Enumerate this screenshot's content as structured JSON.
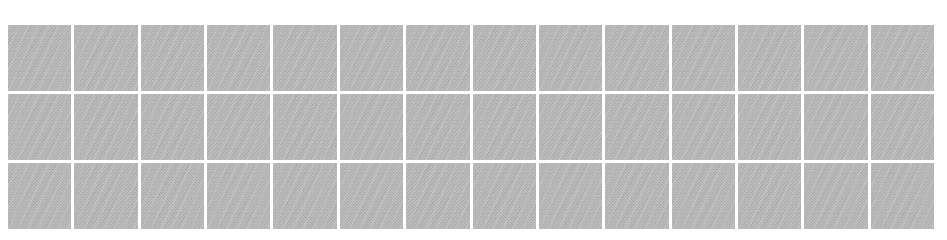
{
  "page": {
    "background_color": "#ffffff",
    "width": 947,
    "height": 240
  },
  "grid": {
    "name": "placeholder-tile-grid",
    "columns": 14,
    "rows": 3,
    "total_tiles": 42,
    "tile_fill_color": "#b5b5b5",
    "gutter_color": "#ffffff",
    "gutter_px": 3,
    "bounds": {
      "left": 8,
      "top": 25,
      "width": 926,
      "height": 204
    },
    "tile_label": "",
    "tiles": [
      {
        "row": 1,
        "col": 1,
        "state": "empty",
        "label": ""
      },
      {
        "row": 1,
        "col": 2,
        "state": "empty",
        "label": ""
      },
      {
        "row": 1,
        "col": 3,
        "state": "empty",
        "label": ""
      },
      {
        "row": 1,
        "col": 4,
        "state": "empty",
        "label": ""
      },
      {
        "row": 1,
        "col": 5,
        "state": "empty",
        "label": ""
      },
      {
        "row": 1,
        "col": 6,
        "state": "empty",
        "label": ""
      },
      {
        "row": 1,
        "col": 7,
        "state": "empty",
        "label": ""
      },
      {
        "row": 1,
        "col": 8,
        "state": "empty",
        "label": ""
      },
      {
        "row": 1,
        "col": 9,
        "state": "empty",
        "label": ""
      },
      {
        "row": 1,
        "col": 10,
        "state": "empty",
        "label": ""
      },
      {
        "row": 1,
        "col": 11,
        "state": "empty",
        "label": ""
      },
      {
        "row": 1,
        "col": 12,
        "state": "empty",
        "label": ""
      },
      {
        "row": 1,
        "col": 13,
        "state": "empty",
        "label": ""
      },
      {
        "row": 1,
        "col": 14,
        "state": "empty",
        "label": ""
      },
      {
        "row": 2,
        "col": 1,
        "state": "empty",
        "label": ""
      },
      {
        "row": 2,
        "col": 2,
        "state": "empty",
        "label": ""
      },
      {
        "row": 2,
        "col": 3,
        "state": "empty",
        "label": ""
      },
      {
        "row": 2,
        "col": 4,
        "state": "empty",
        "label": ""
      },
      {
        "row": 2,
        "col": 5,
        "state": "empty",
        "label": ""
      },
      {
        "row": 2,
        "col": 6,
        "state": "empty",
        "label": ""
      },
      {
        "row": 2,
        "col": 7,
        "state": "empty",
        "label": ""
      },
      {
        "row": 2,
        "col": 8,
        "state": "empty",
        "label": ""
      },
      {
        "row": 2,
        "col": 9,
        "state": "empty",
        "label": ""
      },
      {
        "row": 2,
        "col": 10,
        "state": "empty",
        "label": ""
      },
      {
        "row": 2,
        "col": 11,
        "state": "empty",
        "label": ""
      },
      {
        "row": 2,
        "col": 12,
        "state": "empty",
        "label": ""
      },
      {
        "row": 2,
        "col": 13,
        "state": "empty",
        "label": ""
      },
      {
        "row": 2,
        "col": 14,
        "state": "empty",
        "label": ""
      },
      {
        "row": 3,
        "col": 1,
        "state": "empty",
        "label": ""
      },
      {
        "row": 3,
        "col": 2,
        "state": "empty",
        "label": ""
      },
      {
        "row": 3,
        "col": 3,
        "state": "empty",
        "label": ""
      },
      {
        "row": 3,
        "col": 4,
        "state": "empty",
        "label": ""
      },
      {
        "row": 3,
        "col": 5,
        "state": "empty",
        "label": ""
      },
      {
        "row": 3,
        "col": 6,
        "state": "empty",
        "label": ""
      },
      {
        "row": 3,
        "col": 7,
        "state": "empty",
        "label": ""
      },
      {
        "row": 3,
        "col": 8,
        "state": "empty",
        "label": ""
      },
      {
        "row": 3,
        "col": 9,
        "state": "empty",
        "label": ""
      },
      {
        "row": 3,
        "col": 10,
        "state": "empty",
        "label": ""
      },
      {
        "row": 3,
        "col": 11,
        "state": "empty",
        "label": ""
      },
      {
        "row": 3,
        "col": 12,
        "state": "empty",
        "label": ""
      },
      {
        "row": 3,
        "col": 13,
        "state": "empty",
        "label": ""
      },
      {
        "row": 3,
        "col": 14,
        "state": "empty",
        "label": ""
      }
    ]
  }
}
